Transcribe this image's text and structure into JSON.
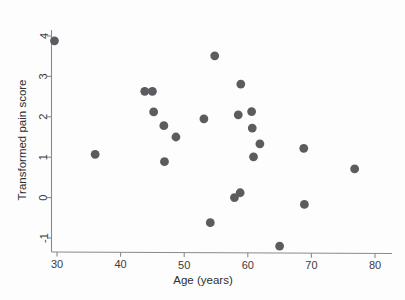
{
  "chart_data": {
    "type": "scatter",
    "title": "",
    "xlabel": "Age (years)",
    "ylabel": "Transformed pain score",
    "xlim": [
      28,
      82
    ],
    "ylim": [
      -1.45,
      4.1
    ],
    "xticks": [
      30,
      40,
      50,
      60,
      70,
      80
    ],
    "yticks": [
      -1,
      0,
      1,
      2,
      3,
      4
    ],
    "xtick_labels": [
      "30",
      "40",
      "50",
      "60",
      "70",
      "80"
    ],
    "ytick_labels": [
      "-1",
      "0",
      "1",
      "2",
      "3",
      "4"
    ],
    "grid": false,
    "legend": null,
    "marker": {
      "shape": "circle",
      "color": "#5c5c60",
      "size": 4.4
    },
    "points": [
      {
        "x": 29.6,
        "y": 3.88
      },
      {
        "x": 36.0,
        "y": 1.07
      },
      {
        "x": 43.8,
        "y": 2.63
      },
      {
        "x": 45.0,
        "y": 2.63
      },
      {
        "x": 45.2,
        "y": 2.12
      },
      {
        "x": 46.8,
        "y": 1.78
      },
      {
        "x": 46.9,
        "y": 0.89
      },
      {
        "x": 48.7,
        "y": 1.5
      },
      {
        "x": 53.1,
        "y": 1.95
      },
      {
        "x": 54.1,
        "y": -0.62
      },
      {
        "x": 54.8,
        "y": 3.51
      },
      {
        "x": 57.9,
        "y": 0.0
      },
      {
        "x": 58.5,
        "y": 2.05
      },
      {
        "x": 58.8,
        "y": 0.12
      },
      {
        "x": 58.9,
        "y": 2.81
      },
      {
        "x": 60.6,
        "y": 2.13
      },
      {
        "x": 60.7,
        "y": 1.72
      },
      {
        "x": 60.9,
        "y": 1.01
      },
      {
        "x": 61.9,
        "y": 1.33
      },
      {
        "x": 65.0,
        "y": -1.2
      },
      {
        "x": 68.8,
        "y": 1.22
      },
      {
        "x": 68.9,
        "y": -0.17
      },
      {
        "x": 76.8,
        "y": 0.71
      }
    ]
  },
  "axes": {
    "x_title": "Age (years)",
    "y_title": "Transformed pain score"
  },
  "colors": {
    "marker": "#5c5c60",
    "axis": "#8a8a8a",
    "text": "#2e2e2e",
    "background": "#fdfdfd"
  }
}
